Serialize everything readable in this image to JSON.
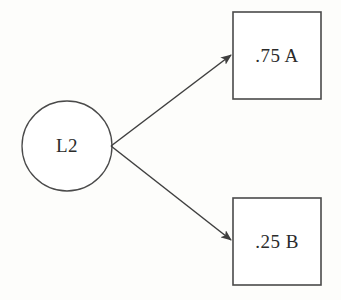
{
  "diagram": {
    "type": "path-diagram",
    "background_color": "#fdfdfb",
    "stroke_color": "#4a4a4a",
    "text_color": "#2b2b2b",
    "fill_color": "#ffffff",
    "latent_node": {
      "shape": "circle",
      "label": "L2",
      "center_x": 67,
      "center_y": 146,
      "radius": 45
    },
    "indicator_nodes": [
      {
        "shape": "rectangle",
        "label": ".75 A",
        "coefficient": ".75",
        "variable": "A",
        "x": 233,
        "y": 12,
        "width": 88,
        "height": 87
      },
      {
        "shape": "rectangle",
        "label": ".25 B",
        "coefficient": ".25",
        "variable": "B",
        "x": 233,
        "y": 198,
        "width": 88,
        "height": 87
      }
    ],
    "edges": [
      {
        "name": "arrow-to-indicator-a",
        "from": "L2",
        "to": ".75 A",
        "direction": "single-headed",
        "x1": 111,
        "y1": 146,
        "x2": 231,
        "y2": 55
      },
      {
        "name": "arrow-to-indicator-b",
        "from": "L2",
        "to": ".25 B",
        "direction": "single-headed",
        "x1": 111,
        "y1": 146,
        "x2": 231,
        "y2": 240
      }
    ]
  }
}
